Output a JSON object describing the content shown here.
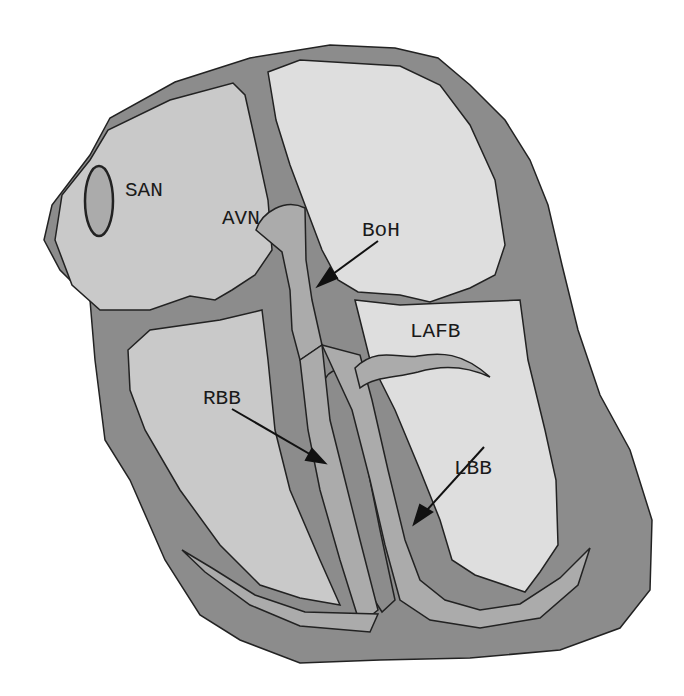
{
  "figure": {
    "labels": {
      "san": "SAN",
      "avn": "AVN",
      "boh": "BoH",
      "lafb": "LAFB",
      "rbb": "RBB",
      "lbb": "LBB"
    },
    "colors": {
      "background": "#ffffff",
      "myocardium": "#8c8c8c",
      "right_chambers": "#c9c9c9",
      "left_chambers": "#dedede",
      "conduction_tissue": "#ababab",
      "outline": "#222222",
      "text": "#1a1a1a"
    }
  }
}
